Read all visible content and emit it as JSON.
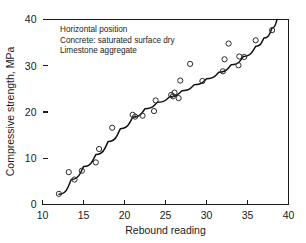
{
  "chart_data": {
    "type": "scatter",
    "title": "",
    "xlabel": "Rebound reading",
    "ylabel": "Compressive strength, MPa",
    "xlim": [
      10,
      40
    ],
    "ylim": [
      0,
      40
    ],
    "xticks": [
      10,
      15,
      20,
      25,
      30,
      35,
      40
    ],
    "yticks": [
      0,
      10,
      20,
      30,
      40
    ],
    "xtick_labels": [
      "10",
      "15",
      "20",
      "25",
      "30",
      "35",
      "40"
    ],
    "ytick_labels": [
      "0",
      "10",
      "20",
      "30",
      "40"
    ],
    "grid": false,
    "legend": null,
    "marker": "open-circle",
    "annotations": [
      "Horizontal position",
      "Concrete: saturated surface dry",
      "Limestone aggregate"
    ],
    "series": [
      {
        "name": "Test specimens",
        "type": "scatter",
        "points": [
          [
            12.0,
            2.3
          ],
          [
            13.2,
            7.0
          ],
          [
            13.9,
            5.4
          ],
          [
            14.8,
            7.3
          ],
          [
            16.5,
            9.1
          ],
          [
            16.9,
            12.0
          ],
          [
            18.5,
            16.6
          ],
          [
            21.0,
            19.4
          ],
          [
            21.3,
            19.0
          ],
          [
            22.2,
            19.2
          ],
          [
            23.6,
            20.2
          ],
          [
            23.8,
            22.5
          ],
          [
            25.7,
            23.7
          ],
          [
            25.9,
            23.4
          ],
          [
            26.1,
            24.2
          ],
          [
            26.6,
            23.0
          ],
          [
            26.8,
            26.8
          ],
          [
            28.0,
            30.4
          ],
          [
            29.5,
            26.7
          ],
          [
            32.0,
            28.8
          ],
          [
            32.2,
            31.4
          ],
          [
            32.7,
            34.8
          ],
          [
            33.9,
            30.1
          ],
          [
            34.0,
            32.0
          ],
          [
            34.6,
            31.9
          ],
          [
            36.0,
            35.5
          ],
          [
            38.0,
            37.7
          ]
        ]
      },
      {
        "name": "Fitted curve",
        "type": "line",
        "points": [
          [
            12.0,
            2.2
          ],
          [
            13.5,
            5.4
          ],
          [
            15.0,
            8.2
          ],
          [
            16.5,
            10.8
          ],
          [
            18.0,
            13.6
          ],
          [
            19.5,
            16.4
          ],
          [
            21.0,
            18.9
          ],
          [
            22.5,
            20.7
          ],
          [
            24.0,
            22.1
          ],
          [
            25.5,
            23.3
          ],
          [
            27.0,
            24.6
          ],
          [
            28.5,
            25.9
          ],
          [
            30.0,
            27.2
          ],
          [
            31.5,
            28.6
          ],
          [
            33.0,
            30.2
          ],
          [
            34.5,
            32.0
          ],
          [
            36.0,
            34.2
          ],
          [
            37.0,
            36.0
          ],
          [
            38.0,
            38.2
          ],
          [
            38.6,
            40.0
          ]
        ]
      }
    ]
  },
  "annotations": {
    "line1": "Horizontal position",
    "line2": "Concrete: saturated surface dry",
    "line3": "Limestone aggregate"
  },
  "axes": {
    "x_title": "Rebound reading",
    "y_title": "Compressive strength, MPa",
    "x_labels": [
      "10",
      "15",
      "20",
      "25",
      "30",
      "35",
      "40"
    ],
    "y_labels": [
      "0",
      "10",
      "20",
      "30",
      "40"
    ]
  },
  "colors": {
    "line": "#111111",
    "marker": "#2b2b2b",
    "axis": "#1a1a1a",
    "background": "#ffffff"
  }
}
